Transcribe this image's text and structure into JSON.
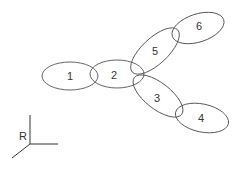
{
  "diagram": {
    "nodes": [
      {
        "id": "1",
        "label": "1",
        "cx": 70,
        "cy": 76,
        "rx": 28,
        "ry": 14,
        "rot": 0
      },
      {
        "id": "2",
        "label": "2",
        "cx": 117,
        "cy": 74,
        "rx": 27,
        "ry": 14,
        "rot": 0
      },
      {
        "id": "3",
        "label": "3",
        "cx": 158,
        "cy": 96,
        "rx": 30,
        "ry": 13,
        "rot": 38
      },
      {
        "id": "4",
        "label": "4",
        "cx": 202,
        "cy": 118,
        "rx": 27,
        "ry": 14,
        "rot": 12
      },
      {
        "id": "5",
        "label": "5",
        "cx": 155,
        "cy": 51,
        "rx": 31,
        "ry": 13,
        "rot": -43
      },
      {
        "id": "6",
        "label": "6",
        "cx": 198,
        "cy": 28,
        "rx": 27,
        "ry": 14,
        "rot": -18
      }
    ],
    "axis_label": "R",
    "stroke_color": "#555555"
  }
}
